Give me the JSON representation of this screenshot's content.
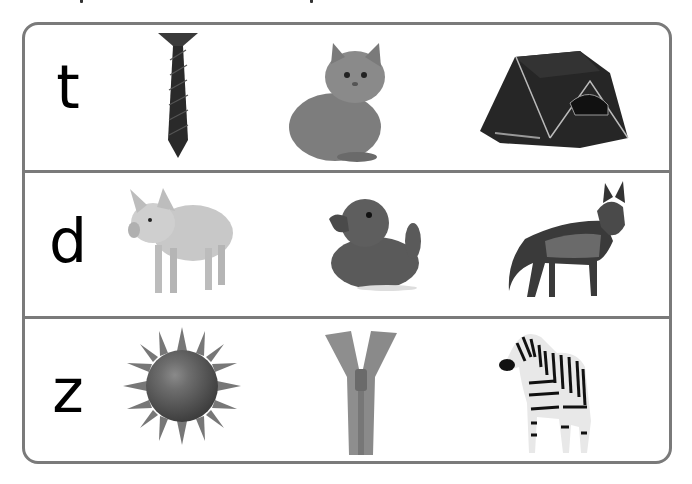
{
  "worksheet": {
    "rows": [
      {
        "letter": "t",
        "pictures": [
          {
            "name": "tie"
          },
          {
            "name": "kitten"
          },
          {
            "name": "tent"
          }
        ]
      },
      {
        "letter": "d",
        "pictures": [
          {
            "name": "pig"
          },
          {
            "name": "duck"
          },
          {
            "name": "dog"
          }
        ]
      },
      {
        "letter": "z",
        "pictures": [
          {
            "name": "sun"
          },
          {
            "name": "zipper"
          },
          {
            "name": "zebra"
          }
        ]
      }
    ],
    "colors": {
      "border": "#7a7a7a",
      "letter": "#000000",
      "background": "#ffffff"
    }
  }
}
